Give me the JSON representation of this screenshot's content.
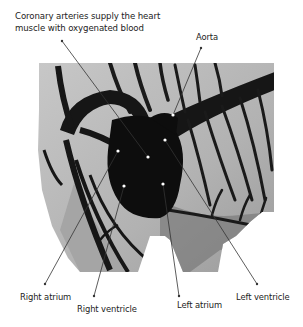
{
  "diagram": {
    "caption_line1": "Coronary arteries supply the heart",
    "caption_line2": "muscle with oxygenated blood",
    "labels": {
      "aorta": "Aorta",
      "right_atrium": "Right atrium",
      "right_ventricle": "Right ventricle",
      "left_atrium": "Left atrium",
      "left_ventricle": "Left ventricle"
    },
    "colors": {
      "background": "#ffffff",
      "muscle": "#b9b9b9",
      "vessels": "#141414",
      "leader_line": "#333333",
      "leader_dot": "#ffffff"
    }
  }
}
